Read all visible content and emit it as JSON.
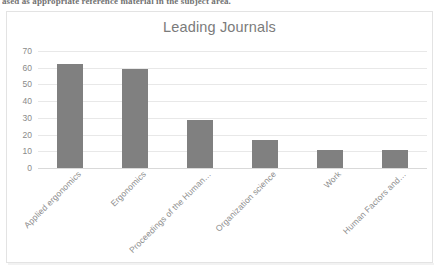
{
  "document": {
    "cut_off_line": "ased as appropriate reference material in the subject area."
  },
  "chart": {
    "title": "Leading Journals",
    "bar_color": "#808080",
    "title_color": "#7b7b7b",
    "axis_text_color": "#8e8e8e",
    "gridline_color": "#e8e8e8",
    "frame_border_color": "#e3e3e3"
  },
  "chart_data": {
    "type": "bar",
    "title": "Leading Journals",
    "xlabel": "",
    "ylabel": "",
    "ylim": [
      0,
      70
    ],
    "yticks": [
      0,
      10,
      20,
      30,
      40,
      50,
      60,
      70
    ],
    "grid": true,
    "legend": false,
    "categories": [
      "Applied ergonomics",
      "Ergonomics",
      "Proceedings of the Human…",
      "Organization science",
      "Work",
      "Human Factors and…"
    ],
    "values": [
      62,
      59,
      29,
      17,
      11,
      11
    ]
  }
}
